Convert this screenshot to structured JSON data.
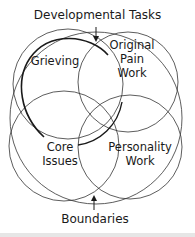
{
  "diagram": {
    "top_label": "Developmental Tasks",
    "bottom_label": "Boundaries",
    "circles": [
      {
        "name": "grieving",
        "label_lines": [
          "Grieving"
        ]
      },
      {
        "name": "original-pain-work",
        "label_lines": [
          "Original",
          "Pain",
          "Work"
        ]
      },
      {
        "name": "core-issues",
        "label_lines": [
          "Core",
          "Issues"
        ]
      },
      {
        "name": "personality-work",
        "label_lines": [
          "Personality",
          "Work"
        ]
      }
    ],
    "colors": {
      "line": "#2a2a2a",
      "text": "#1a1a1a",
      "background": "#ffffff"
    }
  }
}
